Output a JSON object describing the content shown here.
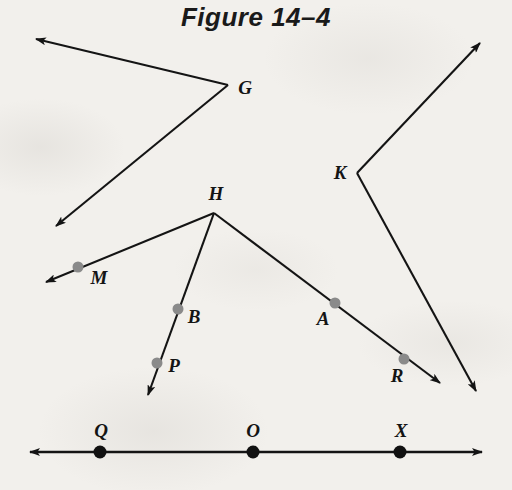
{
  "figure": {
    "title": "Figure 14–4",
    "caption_style": "italic-sans-bold",
    "background_color": "#f2f0ec",
    "ink_color": "#141414",
    "marker_gray": "#8a8a8a",
    "marker_black": "#111111",
    "width": 512,
    "height": 490
  },
  "labels": {
    "G": "G",
    "K": "K",
    "H": "H",
    "M": "M",
    "B": "B",
    "P": "P",
    "A": "A",
    "R": "R",
    "Q": "Q",
    "O": "O",
    "X": "X"
  },
  "vertices": [
    {
      "name": "G",
      "label": "G",
      "x": 228,
      "y": 85,
      "label_x": 245,
      "label_y": 88
    },
    {
      "name": "K",
      "label": "K",
      "x": 357,
      "y": 173,
      "label_x": 340,
      "label_y": 173
    },
    {
      "name": "H",
      "label": "H",
      "x": 214,
      "y": 213,
      "label_x": 216,
      "label_y": 194
    }
  ],
  "marked_points": [
    {
      "name": "M",
      "label": "M",
      "x": 78,
      "y": 267,
      "label_x": 99,
      "label_y": 278,
      "color": "#8a8a8a",
      "radius": 5.5
    },
    {
      "name": "B",
      "label": "B",
      "x": 178,
      "y": 309,
      "label_x": 194,
      "label_y": 317,
      "color": "#8a8a8a",
      "radius": 5.5
    },
    {
      "name": "P",
      "label": "P",
      "x": 157,
      "y": 363,
      "label_x": 174,
      "label_y": 366,
      "color": "#8a8a8a",
      "radius": 5.5
    },
    {
      "name": "A",
      "label": "A",
      "x": 335,
      "y": 303,
      "label_x": 323,
      "label_y": 319,
      "color": "#8a8a8a",
      "radius": 5.5
    },
    {
      "name": "R",
      "label": "R",
      "x": 404,
      "y": 359,
      "label_x": 397,
      "label_y": 376,
      "color": "#8a8a8a",
      "radius": 5.5
    },
    {
      "name": "Q",
      "label": "Q",
      "x": 100,
      "y": 452,
      "label_x": 101,
      "label_y": 431,
      "color": "#111111",
      "radius": 6.5
    },
    {
      "name": "O",
      "label": "O",
      "x": 253,
      "y": 452,
      "label_x": 253,
      "label_y": 431,
      "color": "#111111",
      "radius": 6.5
    },
    {
      "name": "X",
      "label": "X",
      "x": 400,
      "y": 452,
      "label_x": 401,
      "label_y": 431,
      "color": "#111111",
      "radius": 6.5
    }
  ],
  "rays": [
    {
      "name": "ray-G-upper-left",
      "from_vertex": "G",
      "x1": 228,
      "y1": 85,
      "x2": 36,
      "y2": 39,
      "arrow_at_end": true
    },
    {
      "name": "ray-G-lower-left",
      "from_vertex": "G",
      "x1": 228,
      "y1": 85,
      "x2": 56,
      "y2": 226,
      "arrow_at_end": true
    },
    {
      "name": "ray-K-upper-right",
      "from_vertex": "K",
      "x1": 357,
      "y1": 173,
      "x2": 480,
      "y2": 43,
      "arrow_at_end": true
    },
    {
      "name": "ray-K-lower-right",
      "from_vertex": "K",
      "x1": 357,
      "y1": 173,
      "x2": 476,
      "y2": 391,
      "arrow_at_end": true
    },
    {
      "name": "ray-H-through-M",
      "from_vertex": "H",
      "x1": 214,
      "y1": 213,
      "x2": 46,
      "y2": 282,
      "arrow_at_end": true,
      "through": [
        "M"
      ]
    },
    {
      "name": "ray-H-through-B-P",
      "from_vertex": "H",
      "x1": 214,
      "y1": 213,
      "x2": 148,
      "y2": 395,
      "arrow_at_end": true,
      "through": [
        "B",
        "P"
      ]
    },
    {
      "name": "ray-H-through-A-R",
      "from_vertex": "H",
      "x1": 214,
      "y1": 213,
      "x2": 440,
      "y2": 383,
      "arrow_at_end": true,
      "through": [
        "A",
        "R"
      ]
    }
  ],
  "lines": [
    {
      "name": "line-QOX",
      "x1": 30,
      "y1": 452,
      "x2": 482,
      "y2": 452,
      "arrow_at_start": true,
      "arrow_at_end": true,
      "contains": [
        "Q",
        "O",
        "X"
      ]
    }
  ]
}
